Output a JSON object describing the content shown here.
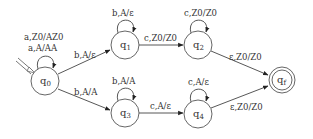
{
  "diagram": {
    "type": "pushdown-automaton",
    "stroke_color": "#444444",
    "text_color": "#333333",
    "states": [
      {
        "id": "q0",
        "name": "q",
        "sub": "0",
        "x": 45,
        "y": 81,
        "r": 14,
        "initial": true,
        "accepting": false
      },
      {
        "id": "q1",
        "name": "q",
        "sub": "1",
        "x": 125,
        "y": 45,
        "r": 14,
        "initial": false,
        "accepting": false
      },
      {
        "id": "q2",
        "name": "q",
        "sub": "2",
        "x": 198,
        "y": 45,
        "r": 14,
        "initial": false,
        "accepting": false
      },
      {
        "id": "q3",
        "name": "q",
        "sub": "3",
        "x": 125,
        "y": 113,
        "r": 14,
        "initial": false,
        "accepting": false
      },
      {
        "id": "q4",
        "name": "q",
        "sub": "4",
        "x": 198,
        "y": 114,
        "r": 14,
        "initial": false,
        "accepting": false
      },
      {
        "id": "qf",
        "name": "q",
        "sub": "f",
        "x": 282,
        "y": 80,
        "r": 13,
        "initial": false,
        "accepting": true
      }
    ],
    "transitions": [
      {
        "from": "q0",
        "to": "q0",
        "labels": [
          "a,Z0/AZ0",
          "a,A/AA"
        ]
      },
      {
        "from": "q0",
        "to": "q1",
        "labels": [
          "b,A/ε"
        ]
      },
      {
        "from": "q0",
        "to": "q3",
        "labels": [
          "b,A/A"
        ]
      },
      {
        "from": "q1",
        "to": "q1",
        "labels": [
          "b,A/ε"
        ]
      },
      {
        "from": "q1",
        "to": "q2",
        "labels": [
          "c,Z0/Z0"
        ]
      },
      {
        "from": "q2",
        "to": "q2",
        "labels": [
          "c,Z0/Z0"
        ]
      },
      {
        "from": "q2",
        "to": "qf",
        "labels": [
          "ε,Z0/Z0"
        ]
      },
      {
        "from": "q3",
        "to": "q3",
        "labels": [
          "b,A/A"
        ]
      },
      {
        "from": "q3",
        "to": "q4",
        "labels": [
          "c,A/ε"
        ]
      },
      {
        "from": "q4",
        "to": "q4",
        "labels": [
          "c,A/ε"
        ]
      },
      {
        "from": "q4",
        "to": "qf",
        "labels": [
          "ε,Z0/Z0"
        ]
      }
    ]
  },
  "labels": {
    "q0_loop_1": "a,Z0/AZ0",
    "q0_loop_2": "a,A/AA",
    "q0_q1": "b,A/ε",
    "q0_q3": "b,A/A",
    "q1_loop": "b,A/ε",
    "q1_q2": "c,Z0/Z0",
    "q2_loop": "c,Z0/Z0",
    "q2_qf": "ε,Z0/Z0",
    "q3_loop": "b,A/A",
    "q3_q4": "c,A/ε",
    "q4_loop": "c,A/ε",
    "q4_qf": "ε,Z0/Z0",
    "state_q": "q",
    "sub_0": "0",
    "sub_1": "1",
    "sub_2": "2",
    "sub_3": "3",
    "sub_4": "4",
    "sub_f": "f"
  }
}
